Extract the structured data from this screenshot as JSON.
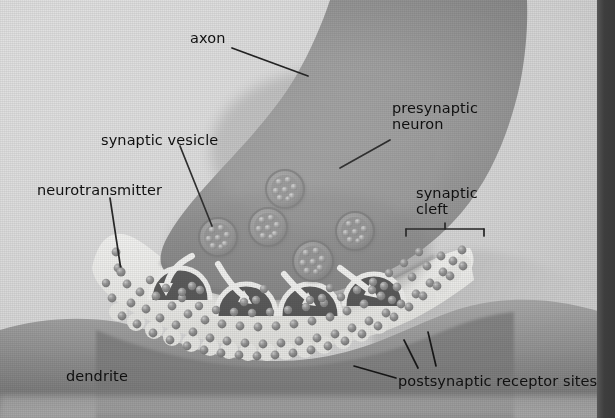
{
  "figure": {
    "style": "grayscale halftone printed illustration",
    "width": 615,
    "height": 418
  },
  "labels": [
    {
      "id": "axon",
      "text": "axon",
      "x": 190,
      "y": 30,
      "align": "left"
    },
    {
      "id": "presynaptic",
      "text": "presynaptic\nneuron",
      "x": 392,
      "y": 100,
      "align": "left"
    },
    {
      "id": "vesicle",
      "text": "synaptic vesicle",
      "x": 101,
      "y": 132,
      "align": "left"
    },
    {
      "id": "neurotrans",
      "text": "neurotransmitter",
      "x": 37,
      "y": 182,
      "align": "left"
    },
    {
      "id": "cleft",
      "text": "synaptic\ncleft",
      "x": 416,
      "y": 185,
      "align": "left"
    },
    {
      "id": "dendrite",
      "text": "dendrite",
      "x": 66,
      "y": 368,
      "align": "left"
    },
    {
      "id": "receptors",
      "text": "postsynaptic receptor sites",
      "x": 398,
      "y": 373,
      "align": "left"
    }
  ],
  "colors": {
    "background_paper": "#d5d5d5",
    "presynaptic_neuron": "#8a8a8a",
    "synaptic_cleft": "#e6e6e4",
    "dendrite": "#9c9c9c",
    "dendrite_shadow": "#7b7b7b",
    "neurotransmitter_dot": "#848484",
    "vesicle_body": "#909090",
    "arrow_white": "#efefef",
    "leader_line": "#141414",
    "text": "#101010",
    "right_band": "#3c3c3c"
  },
  "structures": {
    "presynaptic_neuron": {
      "name": "presynaptic neuron terminal",
      "description": "large mid-gray axon terminal bulb descending from upper right, narrowing into the axon at the top"
    },
    "axon": {
      "name": "axon",
      "description": "narrow upper stalk of the presynaptic neuron"
    },
    "synaptic_cleft": {
      "name": "synaptic cleft",
      "description": "light gap between presynaptic terminal membrane and dendrite surface, filled with neurotransmitter"
    },
    "dendrite": {
      "name": "dendrite",
      "description": "postsynaptic cell body below the cleft with scalloped receptor surface"
    },
    "synaptic_vesicles": {
      "count": 5,
      "granules_per_vesicle": 8,
      "description": "round membrane-bound sacs inside the terminal containing neurotransmitter granules",
      "positions": [
        {
          "cx": 285,
          "cy": 190,
          "r": 19
        },
        {
          "cx": 218,
          "cy": 237,
          "r": 19
        },
        {
          "cx": 268,
          "cy": 227,
          "r": 19
        },
        {
          "cx": 355,
          "cy": 231,
          "r": 19
        },
        {
          "cx": 313,
          "cy": 261,
          "r": 20
        }
      ]
    },
    "release_arrows": {
      "count": 4,
      "description": "curved white arrows showing vesicles migrating to and fusing with the presynaptic membrane"
    },
    "fusion_pores": {
      "count": 4,
      "description": "vesicles fused with the membrane opening into the cleft"
    },
    "neurotransmitter_dots": {
      "approx_count": 120,
      "description": "small spheres released into the synaptic cleft and bound at receptor sites"
    }
  }
}
